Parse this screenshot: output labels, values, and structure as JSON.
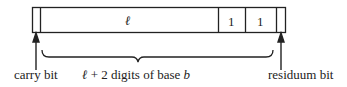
{
  "diagram": {
    "cells": [
      {
        "name": "carry-cell",
        "label": ""
      },
      {
        "name": "main-cell",
        "label": "ℓ"
      },
      {
        "name": "digit-cell-1",
        "label": "1"
      },
      {
        "name": "digit-cell-2",
        "label": "1"
      },
      {
        "name": "residuum-cell",
        "label": ""
      }
    ],
    "labels": {
      "carry": "carry bit",
      "digits_var": "ℓ",
      "digits_text": " + 2 digits of base ",
      "digits_base": "b",
      "residuum": "residuum bit"
    }
  }
}
